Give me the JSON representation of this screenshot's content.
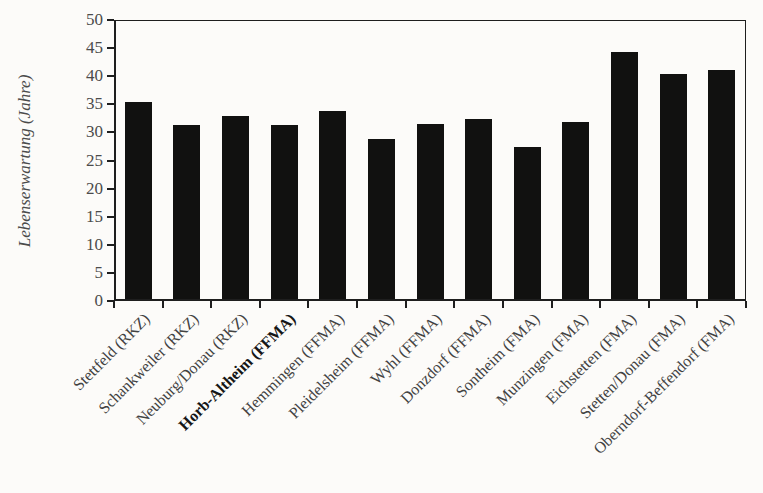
{
  "figure": {
    "background": "#fcfbf9",
    "bar_color": "#111110",
    "axis_color": "#1e1e1e",
    "tick_label_color": "#4b4b4b",
    "category_label_color": "#424242"
  },
  "chart_data": {
    "type": "bar",
    "title": "",
    "xlabel": "",
    "ylabel": "Lebenserwartung (Jahre)",
    "ylim": [
      0,
      50
    ],
    "ytick_step": 5,
    "yticks": [
      0,
      5,
      10,
      15,
      20,
      25,
      30,
      35,
      40,
      45,
      50
    ],
    "grid": false,
    "legend": "none",
    "categories": [
      "Stettfeld (RKZ)",
      "Schankweiler (RKZ)",
      "Neuburg/Donau (RKZ)",
      "Horb-Altheim (FFMA)",
      "Hemmingen (FFMA)",
      "Pleidelsheim (FFMA)",
      "Wyhl (FFMA)",
      "Donzdorf (FFMA)",
      "Sontheim (FMA)",
      "Munzingen (FMA)",
      "Eichstetten (FMA)",
      "Stetten/Donau (FMA)",
      "Oberndorf-Beffendorf (FMA)"
    ],
    "values": [
      35.0,
      31.0,
      32.5,
      31.0,
      33.5,
      28.5,
      31.2,
      32.0,
      27.0,
      31.5,
      44.0,
      40.0,
      40.8
    ],
    "emphasized_category": "Horb-Altheim (FFMA)",
    "emphasized_index": 3
  }
}
